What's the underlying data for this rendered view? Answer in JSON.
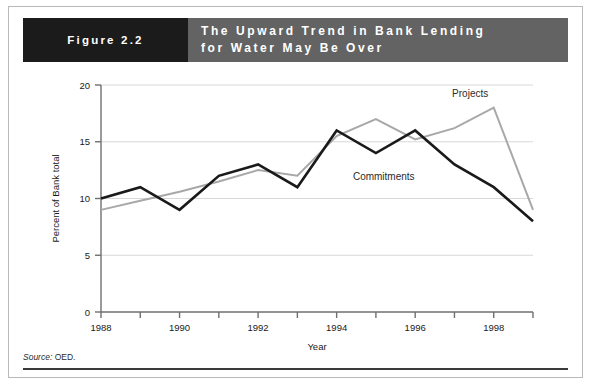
{
  "banner": {
    "figure_label": "Figure 2.2",
    "title_line1": "The Upward Trend in Bank Lending",
    "title_line2": "for Water May Be Over",
    "figure_bg": "#1b1b1b",
    "title_bg": "#636363",
    "text_color": "#ffffff"
  },
  "source": {
    "label": "Source:",
    "value": "OED."
  },
  "chart_data": {
    "type": "line",
    "title": "The Upward Trend in Bank Lending for Water May Be Over",
    "xlabel": "Year",
    "ylabel": "Percent of Bank total",
    "x": [
      1988,
      1989,
      1990,
      1991,
      1992,
      1993,
      1994,
      1995,
      1996,
      1997,
      1998,
      1999
    ],
    "xlim": [
      1988,
      1999
    ],
    "ylim": [
      0,
      20
    ],
    "yticks": [
      0,
      5,
      10,
      15,
      20
    ],
    "ytick_labels": [
      "0",
      "5",
      "10",
      "15",
      "20"
    ],
    "xticks": [
      1988,
      1989,
      1990,
      1991,
      1992,
      1993,
      1994,
      1995,
      1996,
      1997,
      1998,
      1999
    ],
    "xtick_labels": [
      "1988",
      "",
      "1990",
      "",
      "1992",
      "",
      "1994",
      "",
      "1996",
      "",
      "1998",
      ""
    ],
    "grid": "horizontal",
    "legend_position": "inline-annotation",
    "series": [
      {
        "name": "Commitments",
        "color": "#1a1a1a",
        "values": [
          10.0,
          11.0,
          9.0,
          12.0,
          13.0,
          11.0,
          16.0,
          14.0,
          16.0,
          13.0,
          11.0,
          8.0
        ],
        "label_x": 1995.2,
        "label_y": 11.6
      },
      {
        "name": "Projects",
        "color": "#a8a8a8",
        "values": [
          9.0,
          9.8,
          10.6,
          11.5,
          12.5,
          12.0,
          15.5,
          17.0,
          15.2,
          16.2,
          18.0,
          9.0
        ],
        "label_x": 1997.4,
        "label_y": 18.9
      }
    ]
  }
}
